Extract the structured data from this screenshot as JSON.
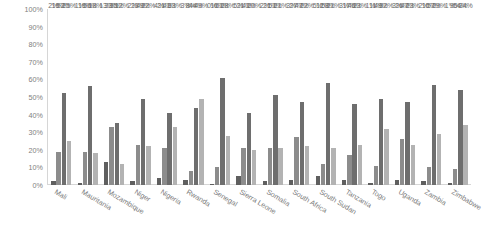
{
  "chart_data": {
    "type": "bar",
    "title": "",
    "subtitle": "",
    "xlabel": "",
    "ylabel": "",
    "ylim": [
      0,
      100
    ],
    "yticks": [
      "0%",
      "10%",
      "20%",
      "30%",
      "40%",
      "50%",
      "60%",
      "70%",
      "80%",
      "90%",
      "100%"
    ],
    "ytick_values": [
      0,
      10,
      20,
      30,
      40,
      50,
      60,
      70,
      80,
      90,
      100
    ],
    "grid": false,
    "legend": "none",
    "value_suffix": "%",
    "colors": {
      "series1": "#5f5f5f",
      "series2": "#8c8c8c",
      "series3": "#6e6e6e",
      "series4": "#b3b3b3",
      "axis": "#d6d6d6",
      "label_text": "#7f7f7f"
    },
    "categories": [
      "Mali",
      "Mauritania",
      "Mozambique",
      "Niger",
      "Nigeria",
      "Rwanda",
      "Senegal",
      "Sierra Leone",
      "Somalia",
      "South Africa",
      "South Sudan",
      "Tanzania",
      "Togo",
      "Uganda",
      "Zambia",
      "Zimbabwe"
    ],
    "series": [
      {
        "name": "series1",
        "values": [
          2,
          1,
          13,
          2,
          4,
          3,
          0,
          5,
          2,
          3,
          5,
          3,
          1,
          3,
          2,
          1
        ],
        "labels": [
          "2%",
          "1%",
          "13%",
          "2%",
          "4%",
          "3%",
          "0%",
          "5%",
          "2%",
          "3%",
          "5%",
          "3%",
          "1%",
          "3%",
          "2%",
          "1%"
        ]
      },
      {
        "name": "series2",
        "values": [
          19,
          19,
          33,
          23,
          21,
          8,
          10,
          21,
          21,
          27,
          12,
          17,
          11,
          26,
          10,
          9
        ],
        "labels": [
          "19%",
          "19%",
          "33%",
          "23%",
          "21%",
          "8%",
          "10%",
          "21%",
          "21%",
          "27%",
          "12%",
          "17%",
          "11%",
          "26%",
          "10%",
          "9%"
        ]
      },
      {
        "name": "series3",
        "values": [
          52,
          56,
          35,
          49,
          41,
          44,
          61,
          41,
          51,
          47,
          58,
          46,
          49,
          47,
          57,
          54
        ],
        "labels": [
          "52%",
          "56%",
          "35%",
          "49%",
          "41%",
          "44%",
          "61%",
          "41%",
          "51%",
          "47%",
          "58%",
          "46%",
          "49%",
          "47%",
          "57%",
          "54%"
        ]
      },
      {
        "name": "series4",
        "values": [
          25,
          18,
          12,
          22,
          33,
          49,
          28,
          20,
          21,
          22,
          21,
          23,
          32,
          23,
          29,
          34
        ],
        "labels": [
          "25%",
          "18%",
          "12%",
          "22%",
          "33%",
          "49%",
          "28%",
          "20%",
          "21%",
          "22%",
          "21%",
          "23%",
          "32%",
          "23%",
          "29%",
          "34%"
        ]
      }
    ]
  }
}
